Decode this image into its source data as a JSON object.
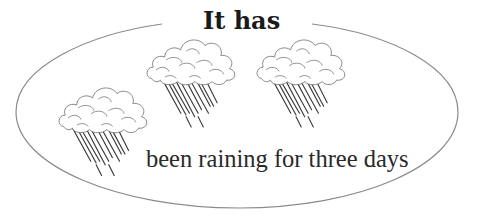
{
  "illustration": {
    "title": "It has",
    "caption": "been raining for three days",
    "elements": {
      "outline": "ellipse-frame",
      "clouds": [
        {
          "name": "rain-cloud-left",
          "x": 58,
          "y": 80
        },
        {
          "name": "rain-cloud-middle",
          "x": 148,
          "y": 32
        },
        {
          "name": "rain-cloud-right",
          "x": 258,
          "y": 32
        }
      ]
    },
    "colors": {
      "background": "#ffffff",
      "ink": "#1a1a1a",
      "line": "#8a8a8a"
    }
  }
}
